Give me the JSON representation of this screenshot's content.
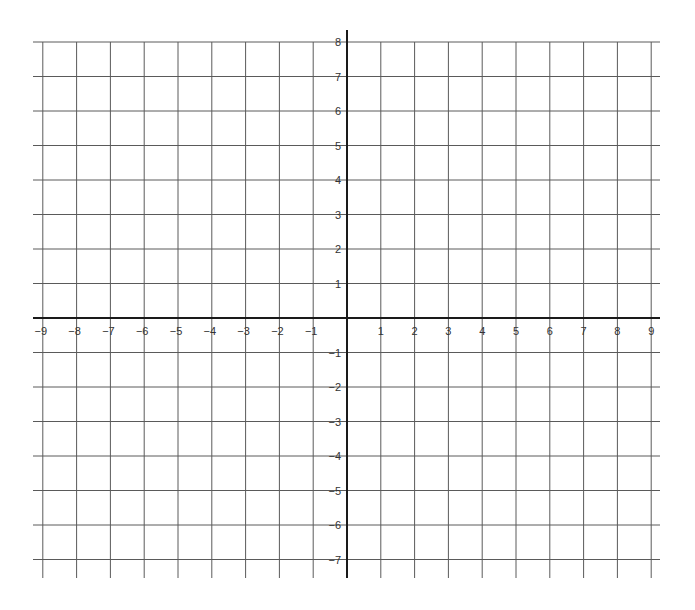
{
  "chart_data": {
    "type": "coordinate-grid",
    "title": "",
    "xlabel": "",
    "ylabel": "",
    "xlim": [
      -9,
      9
    ],
    "ylim": [
      -7,
      8
    ],
    "grid": true,
    "x_ticks": [
      -9,
      -8,
      -7,
      -6,
      -5,
      -4,
      -3,
      -2,
      -1,
      1,
      2,
      3,
      4,
      5,
      6,
      7,
      8,
      9
    ],
    "y_ticks": [
      8,
      7,
      6,
      5,
      4,
      3,
      2,
      1,
      -1,
      -2,
      -3,
      -4,
      -5,
      -6,
      -7
    ],
    "x_tick_labels": [
      "−9",
      "−8",
      "−7",
      "−6",
      "−5",
      "−4",
      "−3",
      "−2",
      "−1",
      "1",
      "2",
      "3",
      "4",
      "5",
      "6",
      "7",
      "8",
      "9"
    ],
    "y_tick_labels": [
      "8",
      "7",
      "6",
      "5",
      "4",
      "3",
      "2",
      "1",
      "−1",
      "−2",
      "−3",
      "−4",
      "−5",
      "−6",
      "−7"
    ],
    "series": []
  },
  "layout": {
    "origin_x": 347,
    "origin_y": 318,
    "unit_x": 33.8,
    "unit_y": 34.5,
    "grid_left": 33,
    "grid_right": 660,
    "grid_top": 30,
    "grid_bottom": 578
  },
  "colors": {
    "grid": "#5a5a5a",
    "axis": "#1a1a1a",
    "label": "#333333",
    "background": "#ffffff"
  }
}
